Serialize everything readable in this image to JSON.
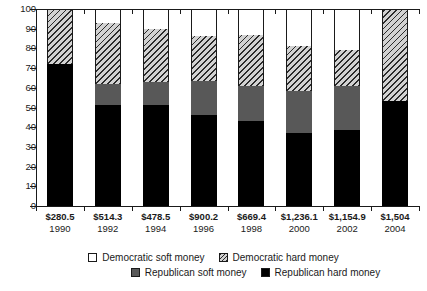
{
  "chart_data": {
    "type": "bar",
    "title": "",
    "subtitle": "",
    "xlabel": "",
    "ylabel": "",
    "ylim": [
      0,
      100
    ],
    "yticks": [
      0,
      10,
      20,
      30,
      40,
      50,
      60,
      70,
      80,
      90,
      100
    ],
    "grid": false,
    "stacked": true,
    "legend_position": "bottom",
    "categories": [
      "1990",
      "1992",
      "1994",
      "1996",
      "1998",
      "2000",
      "2002",
      "2004"
    ],
    "category_totals": [
      "$280.5",
      "$514.3",
      "$478.5",
      "$900.2",
      "$669.4",
      "$1,236.1",
      "$1,154.9",
      "$1,504"
    ],
    "series": [
      {
        "name": "Republican hard money",
        "key": "rep_hard",
        "color": "#000000",
        "values": [
          72,
          51.5,
          51.5,
          46,
          43,
          37,
          38.5,
          53.5
        ]
      },
      {
        "name": "Republican soft money",
        "key": "rep_soft",
        "color": "#585858",
        "values": [
          0,
          10.5,
          11.5,
          17.5,
          18,
          21.5,
          22.5,
          0
        ]
      },
      {
        "name": "Democratic hard money",
        "key": "dem_hard",
        "color": "#d2d2d2",
        "values": [
          28,
          31,
          27,
          23,
          26,
          22.5,
          18,
          46.5
        ]
      },
      {
        "name": "Democratic soft money",
        "key": "dem_soft",
        "color": "#ffffff",
        "values": [
          0,
          7,
          10,
          13.5,
          13,
          19,
          21,
          0
        ]
      }
    ]
  },
  "legend": {
    "items": [
      {
        "label": "Democratic soft money",
        "swatch": "dem-soft"
      },
      {
        "label": "Democratic hard money",
        "swatch": "dem-hard"
      },
      {
        "label": "Republican soft money",
        "swatch": "rep-soft"
      },
      {
        "label": "Republican hard money",
        "swatch": "rep-hard"
      }
    ]
  }
}
